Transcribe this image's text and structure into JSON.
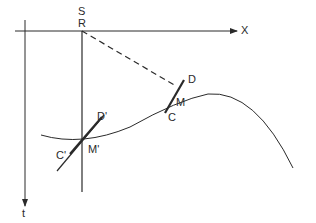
{
  "diagram": {
    "colors": {
      "ink": "#2a2a2a",
      "background": "#ffffff"
    },
    "axes": {
      "x_label": "X",
      "t_label": "t"
    },
    "points": {
      "S": "S",
      "R": "R",
      "D": "D",
      "M": "M",
      "C": "C",
      "D_prime": "D'",
      "M_prime": "M'",
      "C_prime": "C'"
    },
    "elements": [
      "horizontal X axis with arrow",
      "vertical t axis with downward arrow",
      "vertical line through S/R",
      "dashed line from R to M",
      "curved reflector/ray path",
      "segment CD tangent at M",
      "segment C'D' tangent at M'"
    ]
  }
}
